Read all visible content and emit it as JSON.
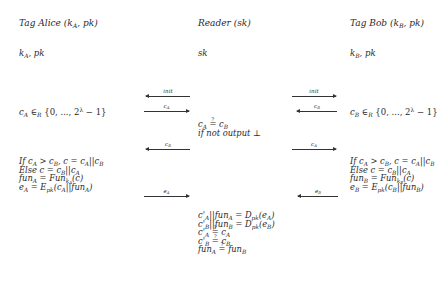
{
  "parties": {
    "alice": {
      "title": "Tag Alice (k_A, pk)",
      "keys": "k_A, pk",
      "random": "c_A ∈_R {0, ..., 2^λ − 1}",
      "compute": [
        "If c_A > c_B, c = c_A||c_B",
        "Else c = c_B||c_A",
        "fun_A = Fun_{k_A}(c)",
        "e_A = E_pk(c_A||fun_A)"
      ]
    },
    "reader": {
      "title": "Reader (sk)",
      "keys": "sk",
      "check1": [
        "c_A ≟ c_B",
        "if not output ⊥"
      ],
      "check2": [
        "c'_A||fun_A = D_pk(e_A)",
        "c'_B||fun_B = D_pk(e_B)",
        "c'_A ≟ c_A",
        "c'_B ≟ c_B",
        "fun_A ≟ fun_B"
      ]
    },
    "bob": {
      "title": "Tag Bob (k_B, pk)",
      "keys": "k_B, pk",
      "random": "c_B ∈_R {0, ..., 2^λ − 1}",
      "compute": [
        "If c_A > c_B, c = c_A||c_B",
        "Else c = c_B||c_A",
        "fun_B = Fun_{k_B}(c)",
        "e_B = E_pk(c_B||fun_B)"
      ]
    }
  },
  "messages": {
    "left": [
      {
        "label": "init",
        "direction": "left"
      },
      {
        "label": "c_A",
        "direction": "right"
      },
      {
        "label": "c_B",
        "direction": "left"
      },
      {
        "label": "e_A",
        "direction": "right"
      }
    ],
    "right": [
      {
        "label": "init",
        "direction": "right"
      },
      {
        "label": "c_B",
        "direction": "left"
      },
      {
        "label": "c_A",
        "direction": "right"
      },
      {
        "label": "e_B",
        "direction": "left"
      }
    ]
  }
}
